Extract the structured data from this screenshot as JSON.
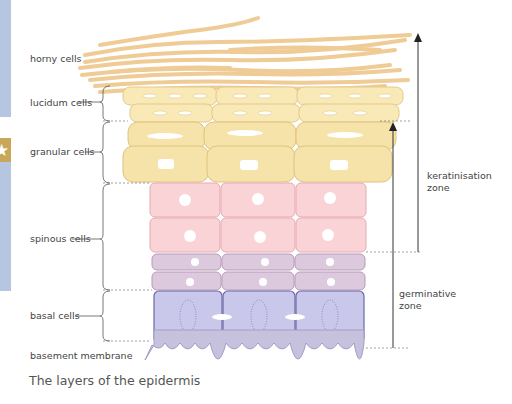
{
  "labels": {
    "horny": "horny cells",
    "lucidum": "lucidum cells",
    "granular": "granular cells",
    "spinous": "spinous cells",
    "basal": "basal cells",
    "basement": "basement membrane"
  },
  "zones": {
    "keratinisation_line1": "keratinisation",
    "keratinisation_line2": "zone",
    "germinative_line1": "germinative",
    "germinative_line2": "zone"
  },
  "caption": "The layers of the epidermis",
  "sidebar": {
    "tab_icon": "star-icon"
  },
  "colors": {
    "horny": "#f2cf9d",
    "lucidum": "#f8e9b6",
    "granular": "#f5e3aa",
    "spinous": "#f9d3d6",
    "prickle": "#ddc9de",
    "basal": "#c9c8ea",
    "membrane": "#c6c1dd",
    "sidebar": "#b6c6e0",
    "tab": "#c9a75a"
  }
}
